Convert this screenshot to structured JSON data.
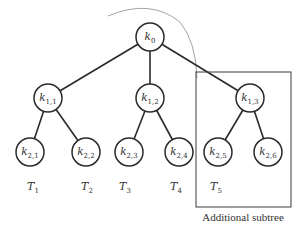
{
  "diagram": {
    "type": "tree",
    "nodes": [
      {
        "id": "k0",
        "base": "k",
        "sub": "0",
        "x": 150,
        "y": 37
      },
      {
        "id": "k11",
        "base": "k",
        "sub": "1,1",
        "x": 48,
        "y": 98
      },
      {
        "id": "k12",
        "base": "k",
        "sub": "1,2",
        "x": 150,
        "y": 98
      },
      {
        "id": "k13",
        "base": "k",
        "sub": "1,3",
        "x": 250,
        "y": 98
      },
      {
        "id": "k21",
        "base": "k",
        "sub": "2,1",
        "x": 30,
        "y": 152
      },
      {
        "id": "k22",
        "base": "k",
        "sub": "2,2",
        "x": 86,
        "y": 152
      },
      {
        "id": "k23",
        "base": "k",
        "sub": "2,3",
        "x": 129,
        "y": 152
      },
      {
        "id": "k24",
        "base": "k",
        "sub": "2,4",
        "x": 179,
        "y": 152
      },
      {
        "id": "k25",
        "base": "k",
        "sub": "2,5",
        "x": 218,
        "y": 152
      },
      {
        "id": "k26",
        "base": "k",
        "sub": "2,6",
        "x": 268,
        "y": 152
      }
    ],
    "edges": [
      [
        "k0",
        "k11"
      ],
      [
        "k0",
        "k12"
      ],
      [
        "k0",
        "k13"
      ],
      [
        "k11",
        "k21"
      ],
      [
        "k11",
        "k22"
      ],
      [
        "k12",
        "k23"
      ],
      [
        "k12",
        "k24"
      ],
      [
        "k13",
        "k25"
      ],
      [
        "k13",
        "k26"
      ]
    ],
    "subtree_labels": [
      {
        "base": "T",
        "sub": "1",
        "x": 33,
        "y": 190
      },
      {
        "base": "T",
        "sub": "2",
        "x": 87,
        "y": 190
      },
      {
        "base": "T",
        "sub": "3",
        "x": 125,
        "y": 190
      },
      {
        "base": "T",
        "sub": "4",
        "x": 176,
        "y": 190
      },
      {
        "base": "T",
        "sub": "5",
        "x": 216,
        "y": 190
      }
    ],
    "highlight_box": {
      "x": 196,
      "y": 72,
      "w": 95,
      "h": 135
    },
    "caption": "Additional subtree"
  }
}
